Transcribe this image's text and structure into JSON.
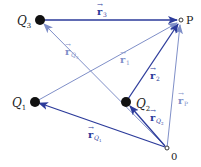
{
  "diagram": {
    "colors": {
      "dark_vector": "#2b3a9a",
      "light_vector": "#7f8fc8",
      "charge": "#111111",
      "text": "#222222",
      "light_text": "#7f8fc8"
    },
    "points": {
      "Q3": {
        "label": "Q",
        "sub": "3",
        "x": 40,
        "y": 20
      },
      "P": {
        "label": "P",
        "x": 181,
        "y": 20
      },
      "Q1": {
        "label": "Q",
        "sub": "1",
        "x": 35,
        "y": 102
      },
      "Q2": {
        "label": "Q",
        "sub": "2",
        "x": 126,
        "y": 102
      },
      "O": {
        "label": "0",
        "x": 167,
        "y": 148
      }
    },
    "vectors": {
      "r3": {
        "symbol": "r",
        "sub": "3",
        "from": "Q3",
        "to": "P",
        "style": "dark"
      },
      "r1": {
        "symbol": "r",
        "sub": "1",
        "from": "Q1",
        "to": "P",
        "style": "light"
      },
      "r2": {
        "symbol": "r",
        "sub": "2",
        "from": "Q2",
        "to": "P",
        "style": "dark"
      },
      "rP": {
        "symbol": "r",
        "sub": "P",
        "from": "O",
        "to": "P",
        "style": "light"
      },
      "rQ1": {
        "symbol": "r",
        "sub": "Q1",
        "from": "O",
        "to": "Q1",
        "style": "dark"
      },
      "rQ2": {
        "symbol": "r",
        "sub": "Q2",
        "from": "O",
        "to": "Q2",
        "style": "dark"
      },
      "rQ3": {
        "symbol": "r",
        "sub": "Q3",
        "from": "O",
        "to": "Q3",
        "style": "light"
      }
    },
    "labels": {
      "Q3": {
        "main": "Q",
        "sub": "3"
      },
      "Q1": {
        "main": "Q",
        "sub": "1"
      },
      "Q2": {
        "main": "Q",
        "sub": "2"
      },
      "P": "P",
      "O": "0",
      "arrow": "→",
      "r": "r",
      "r3_sub": "3",
      "r1_sub": "1",
      "r2_sub": "2",
      "rP_sub": "P",
      "rQ1_sub": "Q1",
      "rQ2_sub": "Q2",
      "rQ3_sub": "Q3",
      "rQ1_sub_main": "Q",
      "rQ1_sub_idx": "1",
      "rQ2_sub_main": "Q",
      "rQ2_sub_idx": "2",
      "rQ3_sub_main": "Q",
      "rQ3_sub_idx": "3"
    }
  }
}
